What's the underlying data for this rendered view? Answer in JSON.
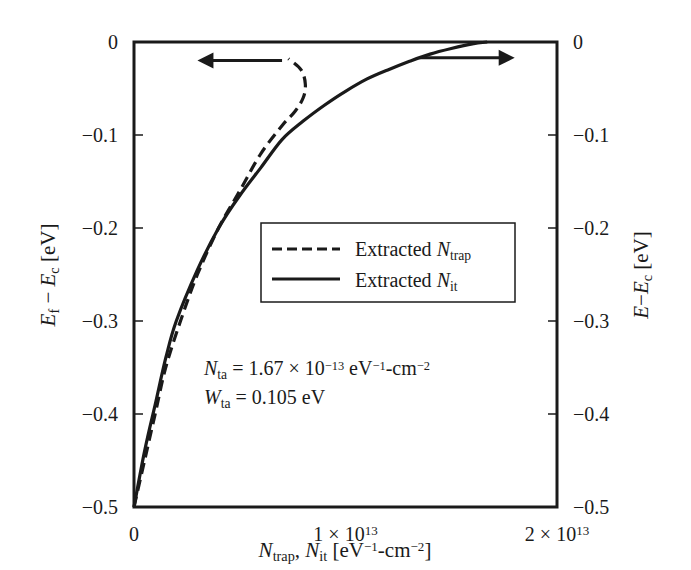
{
  "chart_data": {
    "type": "line",
    "title": "",
    "xlabel": {
      "parts": [
        {
          "text": "N",
          "italic": true
        },
        {
          "text": "trap",
          "sub": true
        },
        {
          "text": ", "
        },
        {
          "text": "N",
          "italic": true
        },
        {
          "text": "it",
          "sub": true
        },
        {
          "text": " [eV"
        },
        {
          "text": "−1",
          "sup": true
        },
        {
          "text": "-cm"
        },
        {
          "text": "−2",
          "sup": true
        },
        {
          "text": "]"
        }
      ],
      "plain": "N_trap, N_it [eV^-1-cm^-2]"
    },
    "ylabel_left": {
      "parts": [
        {
          "text": "E",
          "italic": true
        },
        {
          "text": "f",
          "sub": true
        },
        {
          "text": " − "
        },
        {
          "text": "E",
          "italic": true
        },
        {
          "text": "c",
          "sub": true
        },
        {
          "text": " [eV]"
        }
      ],
      "plain": "E_f − E_c [eV]"
    },
    "ylabel_right": {
      "parts": [
        {
          "text": "E",
          "italic": true
        },
        {
          "text": "−"
        },
        {
          "text": "E",
          "italic": true
        },
        {
          "text": "c",
          "sub": true
        },
        {
          "text": " [eV]"
        }
      ],
      "plain": "E−E_c [eV]"
    },
    "xlim": [
      0,
      20000000000000.0
    ],
    "ylim": [
      -0.5,
      0
    ],
    "x_ticks": [
      {
        "value": 0,
        "label": "0",
        "base": "0",
        "exp": ""
      },
      {
        "value": 10000000000000.0,
        "label": "1 × 10^13",
        "base": "1 × 10",
        "exp": "13"
      },
      {
        "value": 20000000000000.0,
        "label": "2 × 10^13",
        "base": "2 × 10",
        "exp": "13"
      }
    ],
    "y_ticks_left": [
      {
        "value": 0,
        "label": "0"
      },
      {
        "value": -0.1,
        "label": "−0.1"
      },
      {
        "value": -0.2,
        "label": "−0.2"
      },
      {
        "value": -0.3,
        "label": "−0.3"
      },
      {
        "value": -0.4,
        "label": "−0.4"
      },
      {
        "value": -0.5,
        "label": "−0.5"
      }
    ],
    "y_ticks_right": [
      {
        "value": 0,
        "label": "0"
      },
      {
        "value": -0.1,
        "label": "−0.1"
      },
      {
        "value": -0.2,
        "label": "−0.2"
      },
      {
        "value": -0.3,
        "label": "−0.3"
      },
      {
        "value": -0.4,
        "label": "−0.4"
      },
      {
        "value": -0.5,
        "label": "−0.5"
      }
    ],
    "grid": false,
    "legend_position": "center-right inside plot",
    "series": [
      {
        "name": "Extracted N_trap",
        "label_parts": [
          {
            "text": "Extracted "
          },
          {
            "text": "N",
            "italic": true
          },
          {
            "text": "trap",
            "sub": true
          }
        ],
        "style": "dashed",
        "axis": "left",
        "color": "#1a1a1a",
        "points": [
          [
            0.0,
            -0.5
          ],
          [
            500000000000.0,
            -0.45
          ],
          [
            1000000000000.0,
            -0.4
          ],
          [
            1500000000000.0,
            -0.35
          ],
          [
            2200000000000.0,
            -0.3
          ],
          [
            3000000000000.0,
            -0.25
          ],
          [
            4000000000000.0,
            -0.2
          ],
          [
            5000000000000.0,
            -0.16
          ],
          [
            6000000000000.0,
            -0.12
          ],
          [
            7000000000000.0,
            -0.09
          ],
          [
            7600000000000.0,
            -0.075
          ],
          [
            8000000000000.0,
            -0.06
          ],
          [
            8100000000000.0,
            -0.045
          ],
          [
            7900000000000.0,
            -0.03
          ],
          [
            7300000000000.0,
            -0.018
          ]
        ]
      },
      {
        "name": "Extracted N_it",
        "label_parts": [
          {
            "text": "Extracted "
          },
          {
            "text": "N",
            "italic": true
          },
          {
            "text": "it",
            "sub": true
          }
        ],
        "style": "solid",
        "axis": "right",
        "color": "#1a1a1a",
        "points": [
          [
            0.0,
            -0.5
          ],
          [
            500000000000.0,
            -0.44
          ],
          [
            1000000000000.0,
            -0.39
          ],
          [
            1500000000000.0,
            -0.34
          ],
          [
            2000000000000.0,
            -0.3
          ],
          [
            3000000000000.0,
            -0.245
          ],
          [
            4000000000000.0,
            -0.2
          ],
          [
            5000000000000.0,
            -0.165
          ],
          [
            6000000000000.0,
            -0.135
          ],
          [
            7000000000000.0,
            -0.105
          ],
          [
            8000000000000.0,
            -0.085
          ],
          [
            9000000000000.0,
            -0.068
          ],
          [
            10000000000000.0,
            -0.053
          ],
          [
            11000000000000.0,
            -0.04
          ],
          [
            12000000000000.0,
            -0.03
          ],
          [
            13000000000000.0,
            -0.021
          ],
          [
            14000000000000.0,
            -0.013
          ],
          [
            15000000000000.0,
            -0.007
          ],
          [
            16000000000000.0,
            -0.002
          ],
          [
            16700000000000.0,
            0.0
          ]
        ]
      }
    ],
    "arrows": [
      {
        "direction": "left",
        "meaning": "dashed curve uses left axis",
        "x_from": 7000000000000.0,
        "x_to": 3000000000000.0,
        "y": -0.02
      },
      {
        "direction": "right",
        "meaning": "solid curve uses right axis",
        "x_from": 13500000000000.0,
        "x_to": 18000000000000.0,
        "y": -0.017
      }
    ],
    "annotations": [
      {
        "id": "n_ta",
        "parts": [
          {
            "text": "N",
            "italic": true
          },
          {
            "text": "ta",
            "sub": true
          },
          {
            "text": " = 1.67 × 10"
          },
          {
            "text": "−13",
            "sup": true
          },
          {
            "text": " eV"
          },
          {
            "text": "−1",
            "sup": true
          },
          {
            "text": "-cm"
          },
          {
            "text": "−2",
            "sup": true
          }
        ],
        "plain": "N_ta = 1.67 × 10^-13 eV^-1-cm^-2"
      },
      {
        "id": "w_ta",
        "parts": [
          {
            "text": "W",
            "italic": true
          },
          {
            "text": "ta",
            "sub": true
          },
          {
            "text": " = 0.105 eV"
          }
        ],
        "plain": "W_ta = 0.105 eV"
      }
    ]
  },
  "colors": {
    "ink": "#1a1a1a",
    "background": "#ffffff"
  }
}
